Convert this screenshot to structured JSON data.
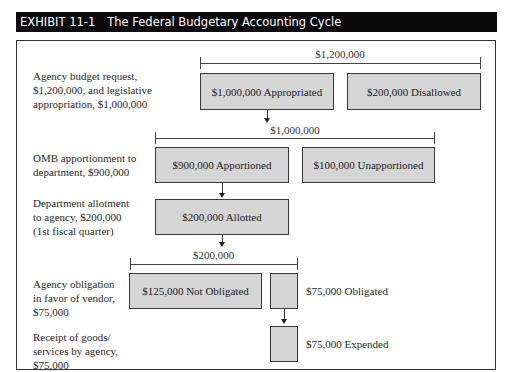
{
  "header": {
    "exhibit": "EXHIBIT 11-1",
    "title": "The Federal Budgetary Accounting Cycle"
  },
  "steps": [
    {
      "description": "Agency budget request,\n$1,200,000, and legislative\nappropriation, $1,000,000",
      "bracket_total": "$1,200,000",
      "boxes": [
        "$1,000,000 Appropriated",
        "$200,000 Disallowed"
      ]
    },
    {
      "description": "OMB apportionment to\ndepartment, $900,000",
      "bracket_total": "$1,000,000",
      "boxes": [
        "$900,000 Apportioned",
        "$100,000 Unapportioned"
      ]
    },
    {
      "description": "Department allotment\nto agency, $200,000\n(1st fiscal quarter)",
      "boxes": [
        "$200,000 Allotted"
      ]
    },
    {
      "description": "Agency obligation\nin favor of vendor,\n$75,000",
      "bracket_total": "$200,000",
      "boxes": [
        "$125,000 Not Obligated"
      ],
      "side_label": "$75,000 Obligated"
    },
    {
      "description": "Receipt of goods/\nservices by agency,\n$75,000",
      "side_label": "$75,000 Expended"
    }
  ],
  "colors": {
    "header_bg": "#0a0a0a",
    "header_text": "#ffffff",
    "box_fill": "#d5d5d5",
    "box_border": "#3a3a3a"
  }
}
